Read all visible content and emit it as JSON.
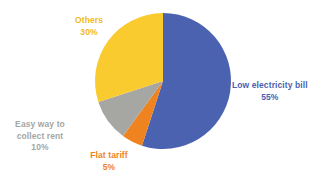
{
  "background_color": "#ffffff",
  "chart_data": {
    "type": "pie",
    "title": "",
    "subtitle": "",
    "xlabel": "",
    "ylabel": "",
    "legend_position": "none",
    "grid": false,
    "units": "percent",
    "start_angle_deg": 0,
    "direction": "clockwise",
    "center": {
      "x": 163,
      "y": 81
    },
    "radius": 68,
    "categories": [
      "Low electricity bill",
      "Flat tariff",
      "Easy way to collect rent",
      "Others"
    ],
    "values": [
      55,
      5,
      10,
      30
    ],
    "colors": [
      "#4a62b0",
      "#ee8320",
      "#a6a6a2",
      "#facb2e"
    ],
    "slices": [
      {
        "key": "low-electricity-bill",
        "label": "Low electricity bill",
        "value": 55,
        "value_text": "55%",
        "color": "#4a62b0",
        "label_color": "#4a62b0"
      },
      {
        "key": "flat-tariff",
        "label": "Flat tariff",
        "value": 5,
        "value_text": "5%",
        "color": "#ee8320",
        "label_color": "#ee8320"
      },
      {
        "key": "easy-way-to-collect-rent",
        "label_line1": "Easy way to",
        "label_line2": "collect rent",
        "label": "Easy way to collect rent",
        "value": 10,
        "value_text": "10%",
        "color": "#a6a6a2",
        "label_color": "#a6a6a2"
      },
      {
        "key": "others",
        "label": "Others",
        "value": 30,
        "value_text": "30%",
        "color": "#facb2e",
        "label_color": "#f2b825"
      }
    ]
  }
}
